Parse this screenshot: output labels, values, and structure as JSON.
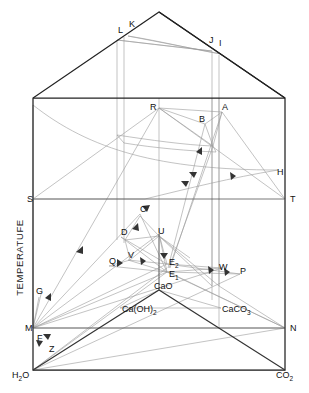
{
  "figure": {
    "type": "phase-diagram-prism",
    "system": "CaO - H2O - CO2",
    "axis_vertical_label": "TEMPERATUFE",
    "background": "#ffffff",
    "line_color_heavy": "#2b2b2b",
    "line_color_light": "#8a8a8a",
    "corner_labels": {
      "left_base": "H",
      "left_base_sub": "2",
      "left_base_tail": "O",
      "right_base": "CO",
      "right_base_sub": "2"
    },
    "compound_labels": [
      {
        "key": "cao",
        "text": "CaO",
        "x": 154,
        "y": 289
      },
      {
        "key": "caoh2",
        "text": "Ca(OH)",
        "sub": "2",
        "x": 122,
        "y": 312
      },
      {
        "key": "caco3",
        "text": "CaCO",
        "sub": "3",
        "x": 222,
        "y": 312
      }
    ],
    "point_labels": [
      {
        "key": "L",
        "text": "L",
        "x": 118,
        "y": 33
      },
      {
        "key": "K",
        "text": "K",
        "x": 129,
        "y": 27
      },
      {
        "key": "J",
        "text": "J",
        "x": 209,
        "y": 43
      },
      {
        "key": "I",
        "text": "I",
        "x": 219,
        "y": 46
      },
      {
        "key": "R",
        "text": "R",
        "x": 150,
        "y": 110
      },
      {
        "key": "B",
        "text": "B",
        "x": 199,
        "y": 122
      },
      {
        "key": "A",
        "text": "A",
        "x": 222,
        "y": 110
      },
      {
        "key": "H",
        "text": "H",
        "x": 277,
        "y": 175
      },
      {
        "key": "S",
        "text": "S",
        "x": 27,
        "y": 202
      },
      {
        "key": "T",
        "text": "T",
        "x": 290,
        "y": 202
      },
      {
        "key": "C",
        "text": "C",
        "x": 140,
        "y": 212
      },
      {
        "key": "D",
        "text": "D",
        "x": 121,
        "y": 235
      },
      {
        "key": "U",
        "text": "U",
        "x": 158,
        "y": 234
      },
      {
        "key": "V",
        "text": "V",
        "x": 128,
        "y": 258
      },
      {
        "key": "Q",
        "text": "Q",
        "x": 109,
        "y": 264
      },
      {
        "key": "E2",
        "text": "E",
        "sub": "2",
        "x": 169,
        "y": 265
      },
      {
        "key": "E1",
        "text": "E",
        "sub": "1",
        "x": 169,
        "y": 277
      },
      {
        "key": "W",
        "text": "W",
        "x": 219,
        "y": 270
      },
      {
        "key": "P",
        "text": "P",
        "x": 240,
        "y": 274
      },
      {
        "key": "G",
        "text": "G",
        "x": 36,
        "y": 294
      },
      {
        "key": "M",
        "text": "M",
        "x": 25,
        "y": 331
      },
      {
        "key": "N",
        "text": "N",
        "x": 290,
        "y": 331
      },
      {
        "key": "F",
        "text": "F",
        "x": 37,
        "y": 341
      },
      {
        "key": "Z",
        "text": "Z",
        "x": 49,
        "y": 352
      }
    ],
    "geometry": {
      "apex": [
        159,
        12
      ],
      "box_top_left": [
        33,
        98
      ],
      "box_top_right": [
        285,
        98
      ],
      "box_bottom_left": [
        33,
        370
      ],
      "box_bottom_right": [
        285,
        370
      ],
      "st_line_y": 199,
      "mn_line_y": 328
    }
  }
}
